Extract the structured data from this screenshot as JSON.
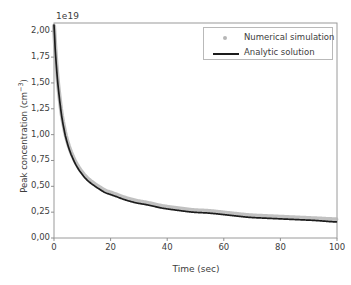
{
  "chart_data": {
    "type": "line",
    "title": "",
    "xlabel": "Time (sec)",
    "ylabel": "Peak concentration (cm⁻³)",
    "y_exponent_label": "1e19",
    "xlim": [
      0,
      100
    ],
    "ylim": [
      0.0,
      2.08
    ],
    "xticks": [
      0,
      20,
      40,
      60,
      80,
      100
    ],
    "xtick_labels": [
      "0",
      "20",
      "40",
      "60",
      "80",
      "100"
    ],
    "yticks": [
      0.0,
      0.25,
      0.5,
      0.75,
      1.0,
      1.25,
      1.5,
      1.75,
      2.0
    ],
    "ytick_labels": [
      "0,00",
      "0,25",
      "0,50",
      "0,75",
      "1,00",
      "1,25",
      "1,50",
      "1,75",
      "2,00"
    ],
    "grid": false,
    "legend_position": "upper right",
    "series": [
      {
        "name": "Numerical simulation",
        "style": "scatter",
        "color": "#b6b6b6",
        "x": [
          0.0,
          0.4,
          0.8,
          1.2,
          1.6,
          2.0,
          2.6,
          3.2,
          4.0,
          5.0,
          6.0,
          7.5,
          9.0,
          11.0,
          13.0,
          15.0,
          18.0,
          21.0,
          25.0,
          29.0,
          33.0,
          38.0,
          43.0,
          49.0,
          55.0,
          62.0,
          69.0,
          76.0,
          84.0,
          92.0,
          100.0
        ],
        "values": [
          2.05,
          1.86,
          1.7,
          1.56,
          1.45,
          1.35,
          1.22,
          1.12,
          1.01,
          0.91,
          0.83,
          0.74,
          0.67,
          0.6,
          0.55,
          0.51,
          0.46,
          0.43,
          0.39,
          0.36,
          0.34,
          0.31,
          0.29,
          0.27,
          0.26,
          0.24,
          0.22,
          0.21,
          0.2,
          0.19,
          0.18
        ]
      },
      {
        "name": "Analytic solution",
        "style": "line",
        "color": "#1c1c1c",
        "x": [
          0.0,
          0.4,
          0.8,
          1.2,
          1.6,
          2.0,
          2.6,
          3.2,
          4.0,
          5.0,
          6.0,
          7.5,
          9.0,
          11.0,
          13.0,
          15.0,
          18.0,
          21.0,
          25.0,
          29.0,
          33.0,
          38.0,
          43.0,
          49.0,
          55.0,
          62.0,
          69.0,
          76.0,
          84.0,
          92.0,
          100.0
        ],
        "values": [
          2.06,
          1.84,
          1.68,
          1.54,
          1.43,
          1.33,
          1.2,
          1.1,
          0.99,
          0.89,
          0.81,
          0.72,
          0.65,
          0.58,
          0.53,
          0.49,
          0.44,
          0.41,
          0.37,
          0.34,
          0.32,
          0.29,
          0.27,
          0.25,
          0.24,
          0.22,
          0.2,
          0.19,
          0.18,
          0.17,
          0.155
        ]
      }
    ]
  }
}
